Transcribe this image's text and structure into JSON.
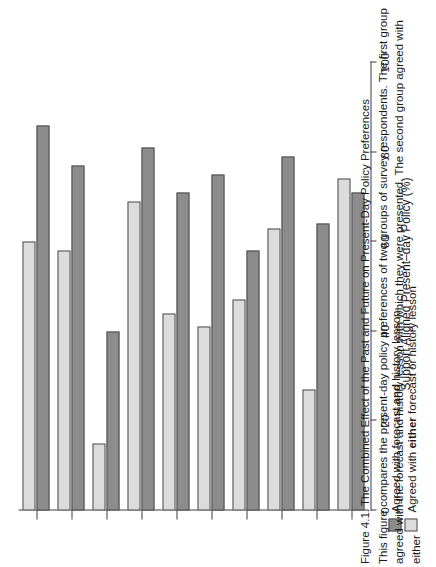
{
  "figure": {
    "caption_title": "Figure 4.1. The Combined Effect of the Past and Future on Present-Day Policy Preferences",
    "caption_body": "This figure compares the present-day policy preferences of two groups of survey respondents. The first group agreed with the forecast and history lesson with which they were presented. The second group agreed with either"
  },
  "legend": {
    "items": [
      {
        "id": "and-series",
        "swatch": "dark",
        "prefix": "Agreed with forecast ",
        "emphasis": "and",
        "suffix": " history lesson",
        "color": "#8c8c8c"
      },
      {
        "id": "either-series",
        "swatch": "light",
        "prefix": "Agreed with ",
        "emphasis": "either",
        "suffix": " forecast or history lesson",
        "color": "#dcdcdc"
      }
    ]
  },
  "chart_data": {
    "type": "bar",
    "orientation": "horizontal",
    "title": "",
    "xlabel": "Support Aligned Present–day Policy (%)",
    "ylabel": "",
    "xlim": [
      0,
      100
    ],
    "xticks": [
      0,
      20,
      40,
      60,
      80,
      100
    ],
    "xticklabels": [
      "0",
      "20",
      "40",
      "60",
      "80",
      "100"
    ],
    "grid": false,
    "legend_position": "bottom-left",
    "categories": [
      "Imm. restrictions",
      "More immigration",
      "Military",
      "International Orgs",
      "Private sector",
      "Regulation",
      "Russia",
      "China",
      "Strike first",
      "Diplomacy"
    ],
    "series": [
      {
        "name": "Agreed with forecast and history lesson",
        "color": "#8c8c8c",
        "values": [
          86,
          77,
          40,
          81,
          71,
          75,
          58,
          79,
          64,
          71
        ]
      },
      {
        "name": "Agreed with either forecast or history lesson",
        "color": "#dcdcdc",
        "values": [
          60,
          58,
          15,
          69,
          44,
          41,
          47,
          63,
          27,
          74
        ]
      }
    ]
  }
}
